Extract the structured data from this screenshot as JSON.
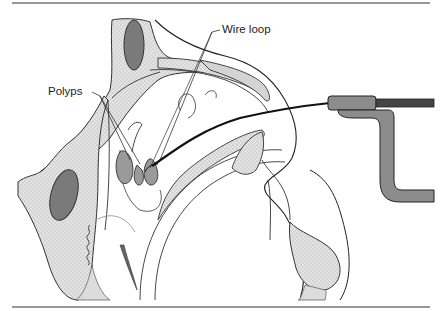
{
  "figure": {
    "labels": {
      "polyps": "Polyps",
      "wire_loop": "Wire loop"
    },
    "colors": {
      "bone_fill": "#e4e4e4",
      "dark_fill": "#7a7a7a",
      "polyp_fill": "#9a9a9a",
      "instrument_fill": "#8c8c8c",
      "line": "#222222",
      "soft_tissue": "#d8d8d8"
    }
  }
}
